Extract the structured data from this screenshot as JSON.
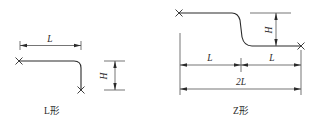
{
  "figures": [
    {
      "id": "l-shape",
      "caption": "L形",
      "dimensions": {
        "length_label": "L",
        "height_label": "H"
      },
      "endpoints": [
        "cross-marker",
        "cross-marker"
      ]
    },
    {
      "id": "z-shape",
      "caption": "Z形",
      "dimensions": {
        "length_left_label": "L",
        "length_right_label": "L",
        "total_length_label": "2L",
        "height_label": "H"
      },
      "endpoints": [
        "cross-marker",
        "cross-marker"
      ]
    }
  ],
  "colors": {
    "line": "#2a2a2a",
    "background": "#ffffff"
  }
}
